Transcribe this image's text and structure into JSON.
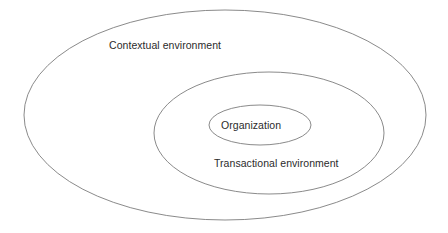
{
  "diagram": {
    "type": "concentric-ellipses",
    "background_color": "#ffffff",
    "stroke_color": "#7d7d7d",
    "text_color": "#2b2b2b",
    "layers": [
      {
        "id": "outer",
        "label": "Contextual environment",
        "cx": 225,
        "cy": 115,
        "rx": 201,
        "ry": 105
      },
      {
        "id": "middle",
        "label": "Transactional environment",
        "cx": 269,
        "cy": 133,
        "rx": 115,
        "ry": 61
      },
      {
        "id": "inner",
        "label": "Organization",
        "cx": 260,
        "cy": 125,
        "rx": 51,
        "ry": 20
      }
    ]
  }
}
